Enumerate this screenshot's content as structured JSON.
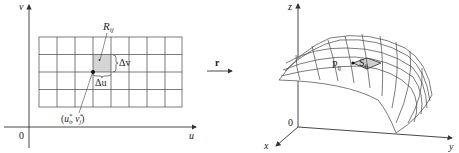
{
  "left_panel": {
    "axes": {
      "vertical": "v",
      "horizontal": "u",
      "origin": "0"
    },
    "grid": {
      "columns": 8,
      "rows": 4
    },
    "region_label": "R",
    "region_subscript": "ij",
    "delta_v": "Δv",
    "delta_u": "Δu",
    "sample_point": "(u*i, v*j)",
    "sample_u": "u",
    "sample_u_sup": "*",
    "sample_u_sub": "i",
    "sample_v": "v",
    "sample_v_sup": "*",
    "sample_v_sub": "j"
  },
  "mapping": {
    "label": "r"
  },
  "right_panel": {
    "axes": {
      "z": "z",
      "x": "x",
      "y": "y",
      "origin": "0"
    },
    "patch_label": "S",
    "patch_subscript": "ij",
    "point_label": "P",
    "point_subscript": "ij"
  },
  "colors": {
    "line": "#333333",
    "shade": "#d4d4d4",
    "background": "#ffffff"
  }
}
